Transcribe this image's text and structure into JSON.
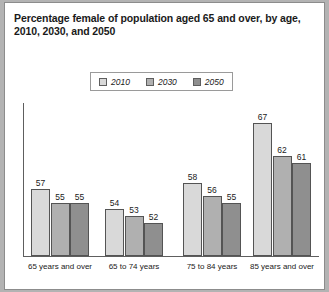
{
  "chart_data": {
    "type": "bar",
    "title": "Percentage female of population aged 65 and over, by age, 2010, 2030, and 2050",
    "title_lines": [
      "Percentage female of population aged 65 and over, by age,",
      "2010, 2030, and 2050"
    ],
    "xlabel": "",
    "ylabel": "",
    "grid": false,
    "legend_position": "top-center",
    "ylim": [
      47,
      70
    ],
    "categories": [
      "65 years and over",
      "65 to 74 years",
      "75 to 84 years",
      "85 years and over"
    ],
    "series": [
      {
        "name": "2010",
        "values": [
          57,
          54,
          58,
          67
        ],
        "color": "#d9d9d9"
      },
      {
        "name": "2030",
        "values": [
          55,
          53,
          56,
          62
        ],
        "color": "#b0b0b0"
      },
      {
        "name": "2050",
        "values": [
          55,
          52,
          55,
          61
        ],
        "color": "#8f8f8f"
      }
    ]
  },
  "colors": {
    "page_background": "#b3b3b3",
    "panel_background": "#ffffff",
    "axis": "#5e5e5e",
    "bar_outline": "#545454",
    "text": "#1a1a1a"
  }
}
